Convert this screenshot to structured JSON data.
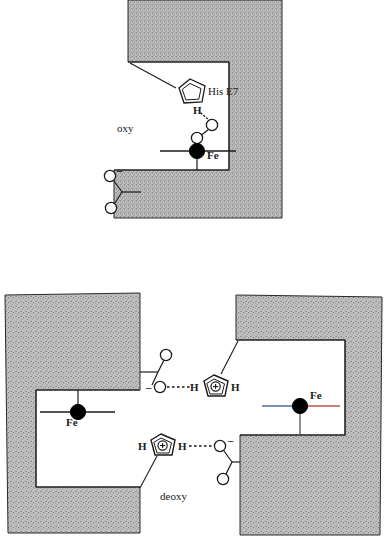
{
  "figure": {
    "title_visible": false,
    "panels": [
      {
        "id": "oxy",
        "state_label": "oxy",
        "residue_label": "His E7",
        "metal_label": "Fe",
        "hydrogen_label": "H",
        "charge_label": "–",
        "description_visible_text": [
          "oxy",
          "His E7",
          "H",
          "Fe",
          "–"
        ]
      },
      {
        "id": "deoxy",
        "state_label": "deoxy",
        "metal_label_left": "Fe",
        "metal_label_right": "Fe",
        "hydrogen_labels": [
          "H",
          "H",
          "H",
          "H"
        ],
        "plus_charge": "+",
        "minus_charge": "–",
        "description_visible_text": [
          "deoxy",
          "Fe",
          "Fe",
          "H",
          "H",
          "H",
          "H",
          "+",
          "+",
          "–",
          "–"
        ]
      }
    ]
  },
  "colors": {
    "protein_fill": "#b9b9b9",
    "protein_stipple": "#6e6e6e",
    "cavity_fill": "#ffffff",
    "outline": "#1a1a1a",
    "atom_outline": "#1a1a1a",
    "iron_fill": "#000000",
    "heme_line_blue": "#4a6fa5",
    "heme_line_red": "#c0504d",
    "bond_line": "#1a1a1a"
  },
  "oxy_panel": {
    "state_label": "oxy",
    "histidine": {
      "label": "His E7",
      "ring_type": "imidazole",
      "charged": false
    },
    "hbond": {
      "donor": "H",
      "style": "dotted"
    },
    "dioxygen": {
      "atoms": [
        "O",
        "O"
      ],
      "geometry": "bent-end-on"
    },
    "iron": {
      "label": "Fe",
      "filled": true
    },
    "carboxylate": {
      "atoms": [
        "O",
        "O"
      ],
      "charge": "–"
    }
  },
  "deoxy_panel": {
    "state_label": "deoxy",
    "subunits": [
      {
        "side": "left",
        "iron_label": "Fe",
        "iron_filled": true
      },
      {
        "side": "right",
        "iron_label": "Fe",
        "iron_filled": true
      }
    ],
    "salt_bridges": [
      {
        "id": "upper",
        "acceptor_atom": "O",
        "acceptor_charge": "–",
        "carbonyl_atom": "O",
        "donor_hydrogen": "H",
        "imidazolium_charge": "+",
        "terminal_hydrogen": "H",
        "style": "dashed"
      },
      {
        "id": "lower",
        "acceptor_atom": "O",
        "acceptor_charge": "–",
        "carbonyl_atom": "O",
        "donor_hydrogen": "H",
        "imidazolium_charge": "+",
        "terminal_hydrogen": "H",
        "style": "dashed"
      }
    ]
  }
}
